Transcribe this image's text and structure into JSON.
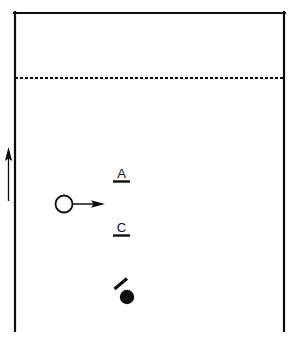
{
  "figure": {
    "background_color": "#ffffff",
    "stroke_color": "#0d0d0d",
    "canvas": {
      "width": 299,
      "height": 338
    }
  },
  "enclosure": {
    "name": "open-bottom rectangle",
    "left_x": 14,
    "right_x": 285,
    "top_y": 12,
    "bottom_y": 330,
    "bottom_open": true,
    "stroke_width": 2.2
  },
  "dashed_divider": {
    "name": "horizontal dashed line",
    "y": 78,
    "x_start": 15,
    "x_end": 284,
    "dash": "3 2",
    "stroke_width": 1.9
  },
  "margin_arrow": {
    "name": "upward direction arrow",
    "x": 8,
    "y_tail": 201,
    "y_head": 148,
    "direction": "up",
    "stroke_width": 1.3
  },
  "open_circle": {
    "name": "open circle marker",
    "cx": 64,
    "cy": 204,
    "r": 8.5,
    "fill": "#ffffff",
    "stroke_width": 1.8
  },
  "motion_arrow": {
    "name": "rightward motion arrow",
    "y": 204,
    "x_tail": 74,
    "x_head": 104,
    "direction": "right",
    "stroke_width": 1.5
  },
  "filled_circle": {
    "name": "filled circle marker",
    "cx": 127,
    "cy": 297,
    "r": 7.2,
    "fill": "#0d0d0d"
  },
  "tick_mark": {
    "name": "diagonal tick mark",
    "x1": 115,
    "y1": 288,
    "x2": 127,
    "y2": 278,
    "stroke_width": 3.2
  },
  "labels": [
    {
      "id": "label-a",
      "text": "A",
      "x": 121,
      "y": 178,
      "underline": {
        "x1": 113,
        "x2": 130,
        "y": 181,
        "stroke_width": 2.4
      }
    },
    {
      "id": "label-c",
      "text": "C",
      "x": 121,
      "y": 232,
      "underline": {
        "x1": 113,
        "x2": 130,
        "y": 235,
        "stroke_width": 2.4
      }
    }
  ]
}
